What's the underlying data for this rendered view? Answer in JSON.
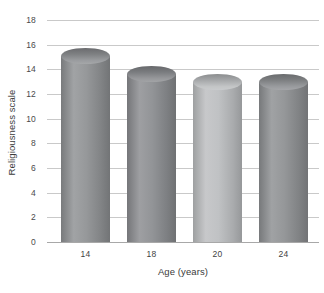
{
  "chart_data": {
    "type": "bar",
    "variant": "cylinder",
    "title": "",
    "subtitle": "",
    "xlabel": "Age (years)",
    "ylabel": "Religiousness scale",
    "categories": [
      "14",
      "18",
      "20",
      "24"
    ],
    "values": [
      15.1,
      13.6,
      13.0,
      13.0
    ],
    "series": [
      {
        "name": "Religiousness scale",
        "values": [
          15.1,
          13.6,
          13.0,
          13.0
        ]
      }
    ],
    "ylim": [
      0,
      18
    ],
    "xlim": null,
    "ytick_labels": [
      "0",
      "2",
      "4",
      "6",
      "8",
      "10",
      "12",
      "14",
      "16",
      "18"
    ],
    "yticks": [
      0,
      2,
      4,
      6,
      8,
      10,
      12,
      14,
      16,
      18
    ],
    "grid": true,
    "grid_axis": "y",
    "legend": false,
    "legend_position": "none",
    "annotations": [],
    "bar_colors": [
      "#8f9194",
      "#8b8d90",
      "#bcbec0",
      "#8e9093"
    ],
    "colors": {
      "gridline": "#c9c9c9",
      "axis_line": "#a8a8a8",
      "background": "#ffffff",
      "tick_text": "#4a4a4a",
      "axis_title_text": "#3a3a3a"
    }
  },
  "axes": {
    "y": {
      "title": "Religiousness scale",
      "ticks": [
        {
          "label": "18",
          "value": 18
        },
        {
          "label": "16",
          "value": 16
        },
        {
          "label": "14",
          "value": 14
        },
        {
          "label": "12",
          "value": 12
        },
        {
          "label": "10",
          "value": 10
        },
        {
          "label": "8",
          "value": 8
        },
        {
          "label": "6",
          "value": 6
        },
        {
          "label": "4",
          "value": 4
        },
        {
          "label": "2",
          "value": 2
        },
        {
          "label": "0",
          "value": 0
        }
      ]
    },
    "x": {
      "title": "Age (years)",
      "categories": [
        {
          "label": "14"
        },
        {
          "label": "18"
        },
        {
          "label": "20"
        },
        {
          "label": "24"
        }
      ]
    }
  }
}
